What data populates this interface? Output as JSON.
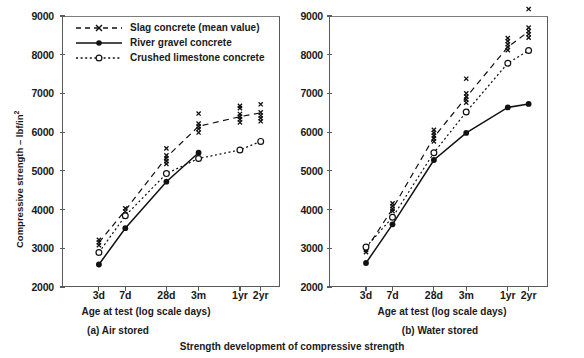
{
  "figure": {
    "caption": "Strength development of compressive strength"
  },
  "legend": {
    "items": [
      {
        "label": "Slag concrete  (mean value)",
        "key": "dashed-cross",
        "marker": "x",
        "color": "#111111"
      },
      {
        "label": "River gravel concrete",
        "key": "solid-filled-circle",
        "marker": "filled-circle",
        "color": "#111111"
      },
      {
        "label": "Crushed limestone concrete",
        "key": "dotted-open-circle",
        "marker": "open-circle",
        "color": "#111111"
      }
    ]
  },
  "axes": {
    "ylabel": "Compressive strength – lbf/in",
    "ylabel_sup": "2",
    "xlabel": "Age at test (log scale days)",
    "yticks": [
      2000,
      3000,
      4000,
      5000,
      6000,
      7000,
      8000,
      9000
    ],
    "ylim": [
      2000,
      9000
    ],
    "xticks": [
      "3d",
      "7d",
      "28d",
      "3m",
      "1yr",
      "2yr"
    ],
    "xtick_positions": [
      0.118,
      0.254,
      0.466,
      0.632,
      0.845,
      0.952
    ]
  },
  "chart_data": [
    {
      "type": "line",
      "id": "air-stored",
      "title": "(a)  Air stored",
      "xlabel": "Age at test (log scale days)",
      "ylabel": "Compressive strength – lbf/in2",
      "categories": [
        "3d",
        "7d",
        "28d",
        "3m",
        "1yr",
        "2yr"
      ],
      "ylim": [
        2000,
        9000
      ],
      "grid": false,
      "legend_position": "top-left",
      "series": [
        {
          "name": "Slag concrete (mean value)",
          "marker": "x",
          "linestyle": "dashed",
          "values": [
            3150,
            3980,
            5350,
            6150,
            6400,
            6500
          ],
          "scatter": [
            [
              3080,
              3150,
              3220
            ],
            [
              3880,
              3950,
              4030
            ],
            [
              5180,
              5250,
              5320,
              5400,
              5580
            ],
            [
              5990,
              6080,
              6150,
              6220,
              6480
            ],
            [
              6250,
              6330,
              6400,
              6470,
              6620,
              6680
            ],
            [
              6280,
              6360,
              6430,
              6510,
              6720
            ]
          ]
        },
        {
          "name": "River gravel concrete",
          "marker": "filled-circle",
          "linestyle": "solid",
          "values": [
            2580,
            3520,
            4720,
            5470,
            null,
            null
          ],
          "scatter": [
            [
              2580
            ],
            [
              3520
            ],
            [
              4720
            ],
            [
              5470
            ],
            [],
            []
          ]
        },
        {
          "name": "Crushed limestone concrete",
          "marker": "open-circle",
          "linestyle": "dotted",
          "values": [
            2890,
            3840,
            4930,
            5320,
            5540,
            5760
          ],
          "scatter": [
            [
              2890
            ],
            [
              3840
            ],
            [
              4930
            ],
            [
              5320
            ],
            [
              5540
            ],
            [
              5760
            ]
          ]
        }
      ]
    },
    {
      "type": "line",
      "id": "water-stored",
      "title": "(b) Water stored",
      "xlabel": "Age at test (log scale days)",
      "ylabel": "Compressive strength – lbf/in2",
      "categories": [
        "3d",
        "7d",
        "28d",
        "3m",
        "1yr",
        "2yr"
      ],
      "ylim": [
        2000,
        9000
      ],
      "grid": false,
      "legend_position": "none",
      "series": [
        {
          "name": "Slag concrete (mean value)",
          "marker": "x",
          "linestyle": "dashed",
          "values": [
            2970,
            4020,
            5870,
            6900,
            8200,
            8600
          ],
          "scatter": [
            [
              2900,
              2960,
              3020
            ],
            [
              3960,
              4020,
              4090,
              4160
            ],
            [
              5760,
              5840,
              5910,
              5980,
              6060
            ],
            [
              6760,
              6840,
              6920,
              7000,
              7380
            ],
            [
              8120,
              8200,
              8270,
              8350,
              8430
            ],
            [
              8440,
              8530,
              8610,
              8700,
              9180
            ]
          ]
        },
        {
          "name": "River gravel concrete",
          "marker": "filled-circle",
          "linestyle": "solid",
          "values": [
            2620,
            3620,
            5280,
            5980,
            6640,
            6730
          ],
          "scatter": [
            [
              2620
            ],
            [
              3620
            ],
            [
              5280
            ],
            [
              5980
            ],
            [
              6640
            ],
            [
              6730
            ]
          ]
        },
        {
          "name": "Crushed limestone concrete",
          "marker": "open-circle",
          "linestyle": "dotted",
          "values": [
            3030,
            3800,
            5470,
            6520,
            7780,
            8110
          ],
          "scatter": [
            [
              3030
            ],
            [
              3800
            ],
            [
              5470
            ],
            [
              6520
            ],
            [
              7780
            ],
            [
              8110
            ]
          ]
        }
      ]
    }
  ]
}
